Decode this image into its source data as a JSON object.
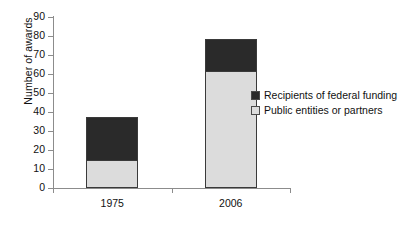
{
  "chart_data": {
    "type": "bar",
    "subtype": "stacked-column",
    "title": "",
    "xlabel": "",
    "ylabel": "Number of awards",
    "categories": [
      "1975",
      "2006"
    ],
    "ylim": [
      0,
      90
    ],
    "yticks": [
      0,
      10,
      20,
      30,
      40,
      50,
      60,
      70,
      80,
      90
    ],
    "ytick_labels": [
      "0",
      "10",
      "20",
      "30",
      "40",
      "50",
      "60",
      "70",
      "80",
      "90"
    ],
    "grid": false,
    "legend_position": "right",
    "series": [
      {
        "name": "Recipients of federal funding",
        "color": "#2a2a2a",
        "values": [
          23,
          17
        ]
      },
      {
        "name": "Public entities or partners",
        "color": "#dcdcdc",
        "values": [
          14,
          61
        ]
      }
    ],
    "totals": [
      37,
      78
    ],
    "stack_order_bottom_to_top": [
      "Public entities or partners",
      "Recipients of federal funding"
    ]
  },
  "colors": {
    "dark_fill": "#2a2a2a",
    "light_fill": "#dcdcdc",
    "bar_border": "#3a3a3a",
    "axis": "#8c8c8c",
    "text": "#111111",
    "background": "#ffffff"
  },
  "legend": {
    "items": [
      {
        "label": "Recipients of federal funding",
        "swatch": "#2a2a2a"
      },
      {
        "label": "Public entities or partners",
        "swatch": "#dcdcdc"
      }
    ]
  }
}
